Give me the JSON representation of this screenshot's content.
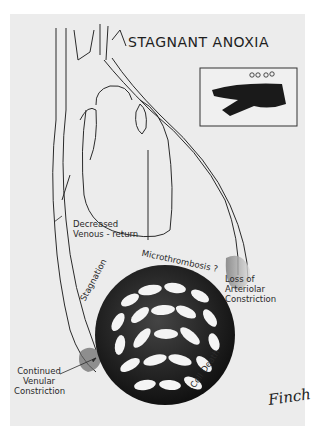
{
  "figure": {
    "title": "STAGNANT ANOXIA",
    "inset": {
      "description": "blood vessel with clumped red cells"
    },
    "labels": {
      "decreased_venous_return_1": "Decreased",
      "decreased_venous_return_2": "Venous - return",
      "microthrombosis": "Microthrombosis ?",
      "stagnation": "Stagnation",
      "loss_arteriolar_1": "Loss of",
      "loss_arteriolar_2": "Arteriolar",
      "loss_arteriolar_3": "Constriction",
      "continued_venular_1": "Continued",
      "continued_venular_2": "Venular",
      "continued_venular_3": "Constriction",
      "cell_death": "Cell Death"
    },
    "signature": "Finch"
  }
}
